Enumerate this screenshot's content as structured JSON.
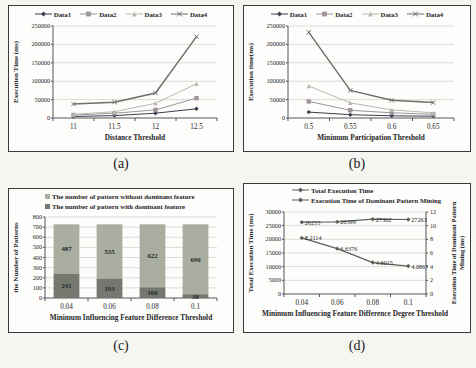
{
  "page": {
    "captions": {
      "a": "(a)",
      "b": "(b)",
      "c": "(c)",
      "d": "(d)"
    }
  },
  "chart_data": [
    {
      "id": "chart-a",
      "type": "line",
      "caption": "(a)",
      "xlabel": "Distance Threshold",
      "ylabel": "Execution Time (ms)",
      "categories": [
        "11",
        "11.5",
        "12",
        "12.5"
      ],
      "ylim": [
        0,
        250000
      ],
      "yticks": [
        "0",
        "50000",
        "100000",
        "150000",
        "200000",
        "250000"
      ],
      "grid": true,
      "legend_position": "top-center",
      "series": [
        {
          "name": "Data1",
          "marker": "diamond",
          "color": "#3c3c50",
          "values": [
            4000,
            6500,
            13000,
            25000
          ]
        },
        {
          "name": "Data2",
          "marker": "square",
          "color": "#9e9499",
          "values": [
            8000,
            13000,
            22000,
            54000
          ]
        },
        {
          "name": "Data3",
          "marker": "triangle",
          "color": "#b9b9b2",
          "values": [
            10000,
            17000,
            40000,
            93000
          ]
        },
        {
          "name": "Data4",
          "marker": "x",
          "color": "#6d6d6a",
          "width": 1.4,
          "values": [
            38000,
            43000,
            68000,
            221000
          ]
        }
      ]
    },
    {
      "id": "chart-b",
      "type": "line",
      "caption": "(b)",
      "xlabel": "Minimum Participation Threshold",
      "ylabel": "Execution time(ms)",
      "categories": [
        "0.5",
        "0.55",
        "0.6",
        "0.65"
      ],
      "ylim": [
        0,
        250000
      ],
      "yticks": [
        "0",
        "50000",
        "100000",
        "150000",
        "200000",
        "250000"
      ],
      "grid": true,
      "legend_position": "top-center",
      "series": [
        {
          "name": "Data1",
          "marker": "diamond",
          "color": "#3c3c50",
          "values": [
            16000,
            9000,
            6000,
            5000
          ]
        },
        {
          "name": "Data2",
          "marker": "square",
          "color": "#9e9499",
          "values": [
            45000,
            21000,
            14000,
            10000
          ]
        },
        {
          "name": "Data3",
          "marker": "triangle",
          "color": "#b9b9b2",
          "values": [
            87000,
            41000,
            22000,
            14000
          ]
        },
        {
          "name": "Data4",
          "marker": "x",
          "color": "#6d6d6a",
          "width": 1.4,
          "values": [
            233000,
            75000,
            48000,
            42000
          ]
        }
      ]
    },
    {
      "id": "chart-c",
      "type": "stacked-bar",
      "caption": "(c)",
      "xlabel": "Minimum Influencing Feature Difference Threshold",
      "ylabel": "the Number of Patterns",
      "categories": [
        "0.04",
        "0.06",
        "0.08",
        "0.1"
      ],
      "ylim": [
        0,
        800
      ],
      "yticks": [
        "0",
        "100",
        "200",
        "300",
        "400",
        "500",
        "600",
        "700",
        "800"
      ],
      "grid": true,
      "legend_position": "top-left",
      "legend": [
        {
          "label": "The number of pattern without dominant feature",
          "color": "#a9aea0"
        },
        {
          "label": "The number of pattern with dominant feature",
          "color": "#74786f"
        }
      ],
      "series": [
        {
          "name": "The number of pattern with dominant feature",
          "color": "#74786f",
          "values": [
            241,
            193,
            106,
            38
          ],
          "labels": [
            "241",
            "193",
            "106",
            "38"
          ]
        },
        {
          "name": "The number of pattern without dominant feature",
          "color": "#a9aea0",
          "values": [
            487,
            535,
            622,
            690
          ],
          "labels": [
            "487",
            "535",
            "622",
            "690"
          ]
        }
      ]
    },
    {
      "id": "chart-d",
      "type": "line-dual",
      "caption": "(d)",
      "xlabel": "Minimum Influencing Feature Difference Degree Threshold",
      "ylabel_left": "Total Execution Time (ms)",
      "ylabel_right": "Execution Time of Dominant Pattern Mining (ms)",
      "ylabel_right_lines": [
        "Execution Time of Dominant Pattern",
        "Mining (ms)"
      ],
      "categories": [
        "0.04",
        "0.06",
        "0.08",
        "0.1"
      ],
      "ylim_left": [
        0,
        30000
      ],
      "yticks_left": [
        "0",
        "5000",
        "10000",
        "15000",
        "20000",
        "25000",
        "30000"
      ],
      "ylim_right": [
        0,
        12
      ],
      "yticks_right": [
        "0",
        "2",
        "4",
        "6",
        "8",
        "10",
        "12"
      ],
      "grid": true,
      "legend_position": "top-left",
      "series": [
        {
          "name": "Total Execution Time",
          "axis": "left",
          "marker": "diamond",
          "color": "#5e5e5b",
          "width": 1.2,
          "values": [
            26255,
            26399,
            27362,
            27263
          ],
          "labels": [
            "26255",
            "26399",
            "27362",
            "27263"
          ]
        },
        {
          "name": "Execution Time of Dominant Pattern Mining",
          "axis": "right",
          "marker": "diamond",
          "color": "#5e5e5b",
          "width": 1.2,
          "values": [
            8.2114,
            6.6376,
            4.6015,
            4.0867
          ],
          "labels": [
            "8.2114",
            "6.6376",
            "4.6015",
            "4.0867"
          ]
        }
      ]
    }
  ]
}
